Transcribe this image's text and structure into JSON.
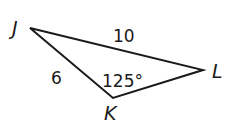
{
  "diagram": {
    "type": "triangle",
    "vertices": {
      "J": {
        "label": "J",
        "x": 30,
        "y": 28
      },
      "K": {
        "label": "K",
        "x": 113,
        "y": 98
      },
      "L": {
        "label": "L",
        "x": 203,
        "y": 70
      }
    },
    "sides": {
      "JL": {
        "label": "10"
      },
      "JK": {
        "label": "6"
      }
    },
    "angles": {
      "K": {
        "label": "125°"
      }
    },
    "stroke_color": "#1a1a1a"
  }
}
